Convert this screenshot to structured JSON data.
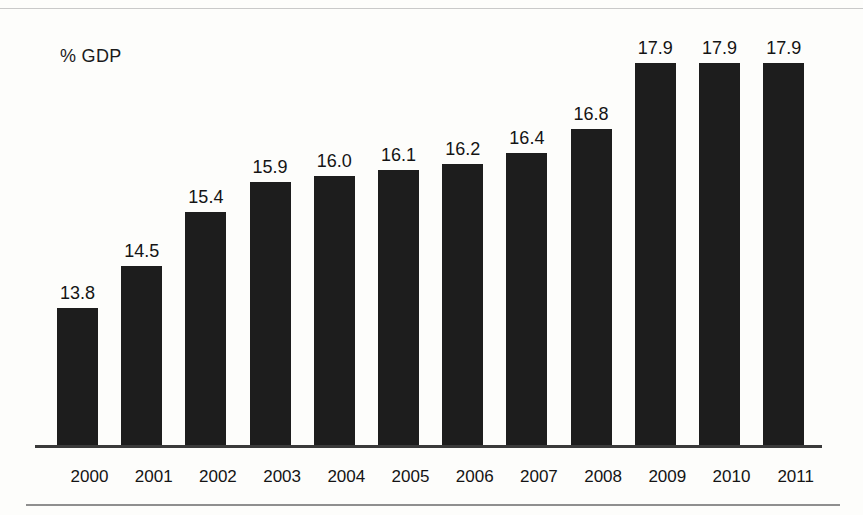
{
  "chart_data": {
    "type": "bar",
    "title": "",
    "subtitle": "",
    "xlabel": "",
    "ylabel": "% GDP",
    "categories": [
      "2000",
      "2001",
      "2002",
      "2003",
      "2004",
      "2005",
      "2006",
      "2007",
      "2008",
      "2009",
      "2010",
      "2011"
    ],
    "values": [
      13.8,
      14.5,
      15.4,
      15.9,
      16.0,
      16.1,
      16.2,
      16.4,
      16.8,
      17.9,
      17.9,
      17.9
    ],
    "value_labels": [
      "13.8",
      "14.5",
      "15.4",
      "15.9",
      "16.0",
      "16.1",
      "16.2",
      "16.4",
      "16.8",
      "17.9",
      "17.9",
      "17.9"
    ],
    "ylim": [
      11.5,
      18.4
    ],
    "grid": false,
    "legend": null,
    "legend_position": "none",
    "bar_color": "#1d1d1d",
    "axis_color": "#3a3a3a",
    "background_color": "#fdfdfb",
    "annotations": [
      "% GDP"
    ]
  },
  "axis": {
    "y_axis_unit_label": "% GDP"
  }
}
